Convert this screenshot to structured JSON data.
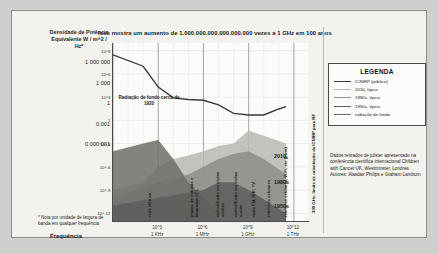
{
  "card": {
    "title": "Isso mostra um aumento de 1.000.000.000.000.000.000 vezes a 1 GHz em 100 anos",
    "y_axis_heading": "Densidade de\nPotência\nEquivalente\nW / m^2 / Hz*",
    "y_plain_values": [
      "1 000 000",
      "1 000",
      "1",
      "0.001",
      "0.000 001"
    ],
    "x_axis_title": "Frequência",
    "footnote": "* Nota\npor unidade de largura\nde banda em qualquer\nfrequência",
    "background_annotation": "Radiação de fundo\ncerca de 1920",
    "icnirp_vertical": "300 GHz: limite de orientação da ICNIRP para RF"
  },
  "legend": {
    "title": "LEGENDA",
    "items": [
      {
        "label": "ICNIRP (público)",
        "color": "#3a3a3a"
      },
      {
        "label": "2010, típico",
        "color": "#b8b8b4"
      },
      {
        "label": "1980s, típico",
        "color": "#8e8e8a"
      },
      {
        "label": "1950s, típico",
        "color": "#5d5d5a"
      },
      {
        "label": "radiação de fundo",
        "color": "#6e6e6a"
      }
    ]
  },
  "source": "Dados retirados de pôster apresentado na conferência científica internacional Children with Cancer UK, Westminster, Londres. Autores: Alasdair Philips e Graham Lamburn",
  "decade_labels": [
    {
      "text": "2010",
      "x": 262,
      "y": 142
    },
    {
      "text": "1980s",
      "x": 262,
      "y": 168
    },
    {
      "text": "1950s",
      "x": 262,
      "y": 192
    }
  ],
  "vertical_band_labels": [
    {
      "text": "rede\nelétrica",
      "x": 136,
      "y": 176
    },
    {
      "text": "placas de indução\ne lâmpadas CFL",
      "x": 178,
      "y": 150
    },
    {
      "text": "radiodifusão em\nondas médias",
      "x": 204,
      "y": 155
    },
    {
      "text": "radiodifusão em\nondas curtas",
      "x": 222,
      "y": 155
    },
    {
      "text": "rádio FM, VHF,\nTV",
      "x": 240,
      "y": 158
    },
    {
      "text": "telefones celulares",
      "x": 255,
      "y": 150
    },
    {
      "text": "telefones celulares, WiFi, etc (pwm)",
      "x": 272,
      "y": 132
    }
  ],
  "chart_data": {
    "type": "area",
    "title": "Isso mostra um aumento de 1.000.000.000.000.000.000 vezes a 1 GHz em 100 anos",
    "xlabel": "Frequência",
    "ylabel": "Densidade de Potência Equivalente W / m^2 / Hz*",
    "grid": true,
    "legend_position": "right",
    "x_scale": "log",
    "y_scale": "log",
    "xlim": [
      1,
      10000000000000.0
    ],
    "ylim": [
      1e-13,
      10000000000.0
    ],
    "x_ticks": [
      {
        "value": 1000,
        "label": "10^3",
        "sublabel": "1 KHz"
      },
      {
        "value": 1000000,
        "label": "10^6",
        "sublabel": "1 MHz"
      },
      {
        "value": 1000000000,
        "label": "10^9",
        "sublabel": "1 GHz"
      },
      {
        "value": 1000000000000,
        "label": "10^12",
        "sublabel": "1 THz"
      }
    ],
    "y_ticks": [
      {
        "value": 1000000000.0,
        "label": "10^9"
      },
      {
        "value": 1000000.0,
        "label": "10^6"
      },
      {
        "value": 1000.0,
        "label": "10^3"
      },
      {
        "value": 1,
        "label": "1"
      },
      {
        "value": 0.001,
        "label": "10^-3"
      },
      {
        "value": 1e-06,
        "label": "10^-6"
      },
      {
        "value": 1e-09,
        "label": "10^-9"
      },
      {
        "value": 1e-12,
        "label": "10^-12"
      }
    ],
    "series": [
      {
        "name": "ICNIRP (público)",
        "type": "line",
        "color": "#3a3a3a",
        "points": [
          {
            "x": 1,
            "y": 300000000.0
          },
          {
            "x": 100,
            "y": 10000000.0
          },
          {
            "x": 1000,
            "y": 20000.0
          },
          {
            "x": 10000,
            "y": 800.0
          },
          {
            "x": 100000,
            "y": 500.0
          },
          {
            "x": 1000000,
            "y": 400.0
          },
          {
            "x": 10000000.0,
            "y": 100.0
          },
          {
            "x": 100000000.0,
            "y": 8
          },
          {
            "x": 1000000000.0,
            "y": 5
          },
          {
            "x": 10000000000.0,
            "y": 5
          },
          {
            "x": 100000000000.0,
            "y": 30
          },
          {
            "x": 300000000000.0,
            "y": 60
          }
        ]
      },
      {
        "name": "2010, típico",
        "type": "area",
        "color": "#b8b8b4",
        "points": [
          {
            "x": 1,
            "y": 1e-09
          },
          {
            "x": 100,
            "y": 1e-08
          },
          {
            "x": 1000,
            "y": 1e-06
          },
          {
            "x": 10000,
            "y": 1e-05
          },
          {
            "x": 100000,
            "y": 3e-05
          },
          {
            "x": 1000000.0,
            "y": 0.0001
          },
          {
            "x": 10000000.0,
            "y": 0.0005
          },
          {
            "x": 100000000.0,
            "y": 0.001
          },
          {
            "x": 1000000000.0,
            "y": 0.05
          },
          {
            "x": 10000000000.0,
            "y": 0.01
          },
          {
            "x": 300000000000.0,
            "y": 0.001
          }
        ]
      },
      {
        "name": "1980s, típico",
        "type": "area",
        "color": "#8e8e8a",
        "points": [
          {
            "x": 1,
            "y": 1e-10
          },
          {
            "x": 1000,
            "y": 1e-08
          },
          {
            "x": 100000.0,
            "y": 1e-07
          },
          {
            "x": 1000000.0,
            "y": 1e-06
          },
          {
            "x": 10000000.0,
            "y": 1e-05
          },
          {
            "x": 100000000.0,
            "y": 5e-05
          },
          {
            "x": 1000000000.0,
            "y": 0.0001
          },
          {
            "x": 10000000000.0,
            "y": 1e-05
          },
          {
            "x": 300000000000.0,
            "y": 1e-07
          }
        ]
      },
      {
        "name": "1950s, típico",
        "type": "area",
        "color": "#5d5d5a",
        "points": [
          {
            "x": 1,
            "y": 1e-11
          },
          {
            "x": 1000,
            "y": 1e-10
          },
          {
            "x": 1000000.0,
            "y": 1e-09
          },
          {
            "x": 10000000.0,
            "y": 1e-08
          },
          {
            "x": 100000000.0,
            "y": 1e-08
          },
          {
            "x": 1000000000.0,
            "y": 1e-09
          },
          {
            "x": 300000000000.0,
            "y": 1e-12
          }
        ]
      },
      {
        "name": "radiação de fundo",
        "type": "area",
        "color": "#6e6e6a",
        "points": [
          {
            "x": 1,
            "y": 0.0001
          },
          {
            "x": 100,
            "y": 0.001
          },
          {
            "x": 1000,
            "y": 0.003
          },
          {
            "x": 10000.0,
            "y": 1e-05
          },
          {
            "x": 100000.0,
            "y": 1e-08
          },
          {
            "x": 1000000.0,
            "y": 1e-10
          },
          {
            "x": 10000000.0,
            "y": 1e-12
          }
        ]
      }
    ]
  }
}
